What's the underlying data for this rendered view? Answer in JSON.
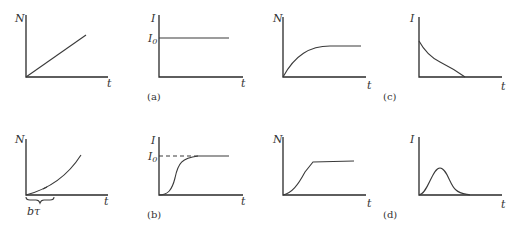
{
  "figure": {
    "captions": [
      "(a)",
      "(b)",
      "(c)",
      "(d)"
    ],
    "panels": [
      {
        "id": "a-N",
        "caption": "(a)",
        "ylabel": "N",
        "xlabel": "t",
        "shape": "linear increase from origin"
      },
      {
        "id": "a-I",
        "caption": "(a)",
        "ylabel": "I",
        "xlabel": "t",
        "y_marker": "I0",
        "shape": "constant at I0"
      },
      {
        "id": "c-N",
        "caption": "(c)",
        "ylabel": "N",
        "xlabel": "t",
        "shape": "rises and saturates"
      },
      {
        "id": "c-I",
        "caption": "(c)",
        "ylabel": "I",
        "xlabel": "t",
        "shape": "decays from finite value to zero"
      },
      {
        "id": "b-N",
        "caption": "(b)",
        "ylabel": "N",
        "xlabel": "t",
        "annotation": "bτ",
        "shape": "quadratic-like growth after delay bτ"
      },
      {
        "id": "b-I",
        "caption": "(b)",
        "ylabel": "I",
        "xlabel": "t",
        "y_marker": "I0",
        "shape": "sigmoid rising to I0 (dashed asymptote)"
      },
      {
        "id": "d-N",
        "caption": "(d)",
        "ylabel": "N",
        "xlabel": "t",
        "shape": "S-curve rising to plateau"
      },
      {
        "id": "d-I",
        "caption": "(d)",
        "ylabel": "I",
        "xlabel": "t",
        "shape": "single bell-shaped pulse"
      }
    ],
    "labels": {
      "N": "N",
      "I": "I",
      "t": "t",
      "I0_main": "I",
      "I0_sub": "0",
      "btau": "bτ",
      "cap_a": "(a)",
      "cap_b": "(b)",
      "cap_c": "(c)",
      "cap_d": "(d)"
    }
  }
}
